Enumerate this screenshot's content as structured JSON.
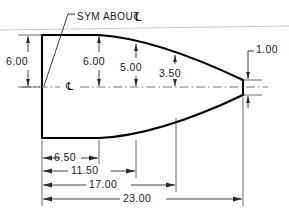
{
  "drawing": {
    "title": "Symmetric tapered profile part drawing",
    "note": {
      "label": "SYM  ABOUT",
      "symbol": "℄",
      "symbol_name": "centerline-symbol"
    },
    "centerline_marker": "℄",
    "colors": {
      "outline": "#000000",
      "dimension_line": "#2a2a2a",
      "extension_line": "#3a3a3a",
      "centerline": "#555555",
      "background": "#ffffff",
      "scan_artifact": "#c9c9c9",
      "text": "#1a1a1a"
    },
    "vertical_dimensions": [
      {
        "name": "overall-height-left",
        "value": "6.00",
        "x": 22,
        "y": 62
      },
      {
        "name": "height-at-6p50",
        "value": "6.00",
        "x": 99,
        "y": 62
      },
      {
        "name": "height-at-11p50",
        "value": "5.00",
        "x": 136,
        "y": 68
      },
      {
        "name": "height-at-17p00",
        "value": "3.50",
        "x": 175,
        "y": 74
      },
      {
        "name": "nose-height",
        "value": "1.00",
        "x": 258,
        "y": 62
      }
    ],
    "horizontal_dimensions": [
      {
        "name": "length-6p50",
        "value": "6.50",
        "y": 158,
        "x1": 42,
        "x2": 99
      },
      {
        "name": "length-11p50",
        "value": "11.50",
        "y": 171,
        "x1": 42,
        "x2": 136
      },
      {
        "name": "length-17p00",
        "value": "17.00",
        "y": 185,
        "x1": 42,
        "x2": 176
      },
      {
        "name": "length-23p00",
        "value": "23.00",
        "y": 199,
        "x1": 42,
        "x2": 243
      }
    ]
  }
}
